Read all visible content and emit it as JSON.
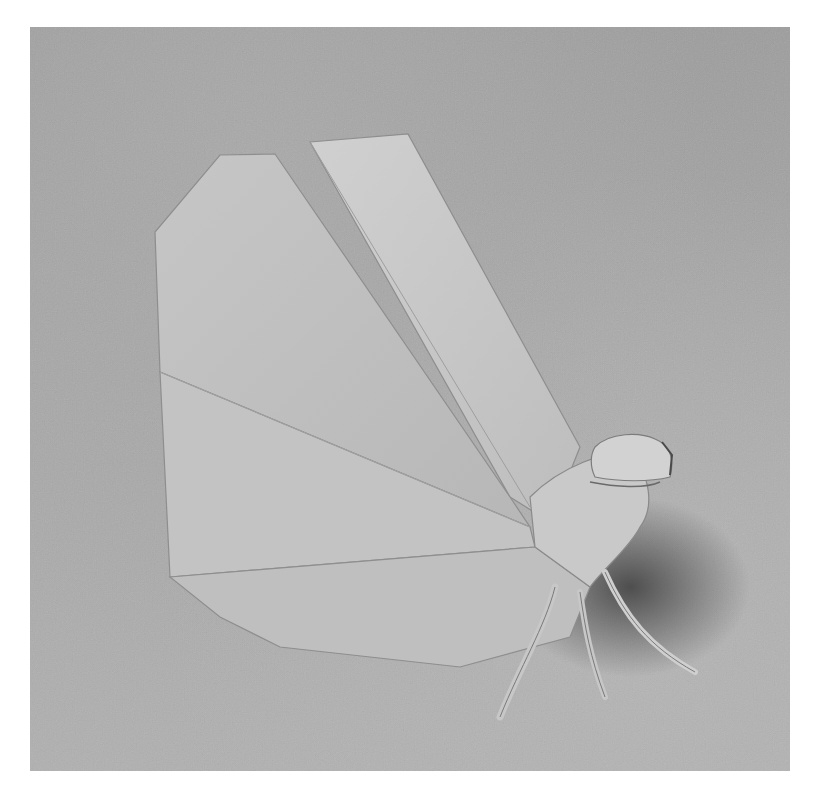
{
  "image": {
    "description": "Black-and-white photograph of an origami insect figure with a large fan-shaped folded wing and thin legs, standing on a textured paper surface",
    "subject": "origami insect",
    "palette": {
      "background": "#a6a6a6",
      "paper_light": "#cfcfcf",
      "paper_mid": "#bdbdbd",
      "shadow": "#5a5a5a",
      "page": "#ffffff"
    }
  }
}
